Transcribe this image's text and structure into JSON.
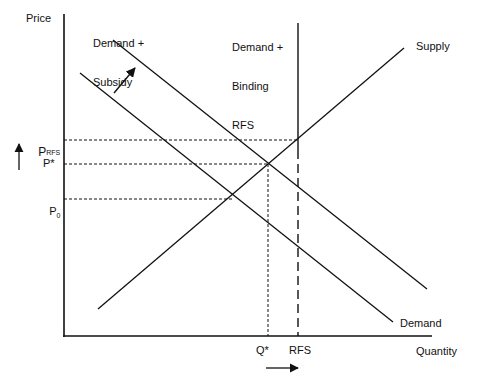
{
  "axes": {
    "y_label": "Price",
    "x_label": "Quantity"
  },
  "curves": {
    "supply": "Supply",
    "demand": "Demand",
    "demand_subsidy": [
      "Demand +",
      "Subsidy"
    ],
    "demand_binding_rfs": [
      "Demand +",
      "Binding",
      "RFS"
    ]
  },
  "price_levels": {
    "p_rfs": {
      "main": "P",
      "sub": "RFS"
    },
    "p_star": {
      "main": "P*"
    },
    "p_0": {
      "main": "P",
      "sub": "0"
    }
  },
  "quantity_levels": {
    "q_star": "Q*",
    "rfs": "RFS"
  },
  "arrows": {
    "price_up": "↑",
    "quantity_right": "→"
  },
  "colors": {
    "line": "#111111",
    "background": "#ffffff"
  }
}
